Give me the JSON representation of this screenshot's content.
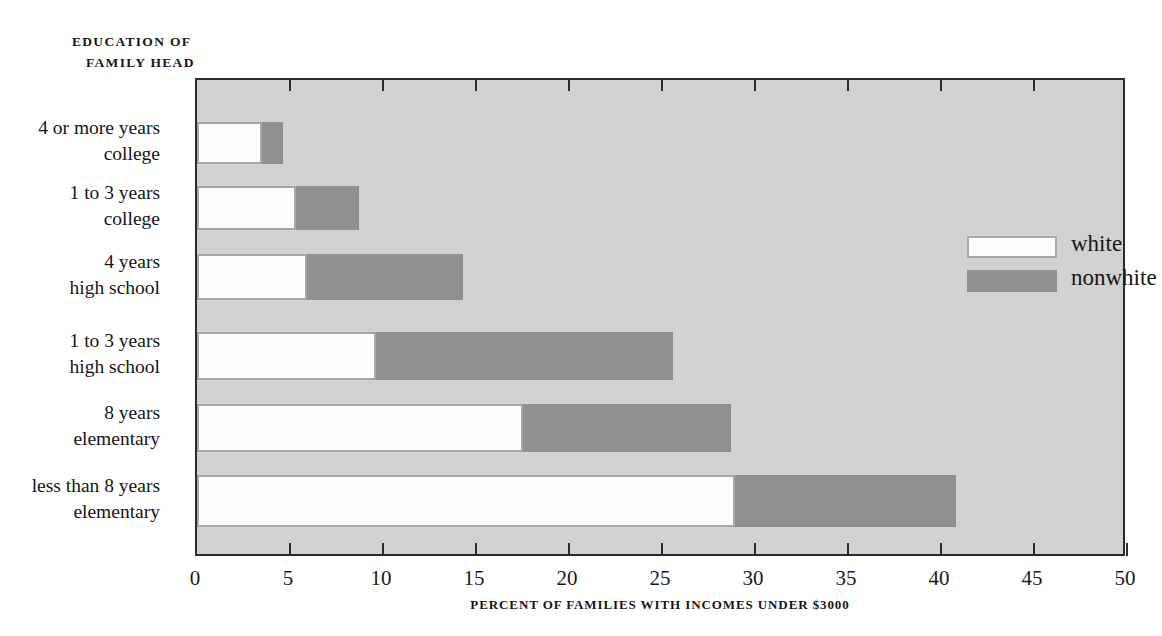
{
  "chart_data": {
    "type": "bar",
    "orientation": "horizontal",
    "stacked": true,
    "title": "",
    "ylabel_header": {
      "line1": "EDUCATION OF",
      "line2": "FAMILY HEAD"
    },
    "xlabel": "PERCENT OF FAMILIES WITH INCOMES UNDER $3000",
    "xlim": [
      0,
      50
    ],
    "xticks": [
      0,
      5,
      10,
      15,
      20,
      25,
      30,
      35,
      40,
      45,
      50
    ],
    "xtick_labels": [
      "0",
      "5",
      "10",
      "15",
      "20",
      "25",
      "30",
      "35",
      "40",
      "45",
      "50"
    ],
    "grid": false,
    "legend_position": "upper right",
    "categories": [
      {
        "line1": "4 or more years",
        "line2": "college"
      },
      {
        "line1": "1 to 3 years",
        "line2": "college"
      },
      {
        "line1": "4 years",
        "line2": "high school"
      },
      {
        "line1": "1 to 3 years",
        "line2": "high school"
      },
      {
        "line1": "8 years",
        "line2": "elementary"
      },
      {
        "line1": "less than 8 years",
        "line2": "elementary"
      }
    ],
    "category_labels": [
      "4 or more years college",
      "1 to 3 years college",
      "4 years high school",
      "1 to 3 years high school",
      "8 years elementary",
      "less than 8 years elementary"
    ],
    "series": [
      {
        "name": "white",
        "color": "#fdfdfd",
        "values": [
          3.5,
          5.3,
          5.9,
          9.6,
          17.5,
          28.9
        ]
      },
      {
        "name": "nonwhite",
        "color": "#909090",
        "values": [
          4.6,
          8.7,
          14.3,
          25.6,
          28.7,
          40.8
        ]
      }
    ],
    "series_note": "nonwhite values are cumulative bar endpoints (overlaid, not additive)",
    "plot_background": "#d2d2d2",
    "axis_color": "#2b2b2b"
  },
  "legend": {
    "items": [
      {
        "label": "white",
        "color": "#fdfdfd"
      },
      {
        "label": "nonwhite",
        "color": "#909090"
      }
    ]
  }
}
